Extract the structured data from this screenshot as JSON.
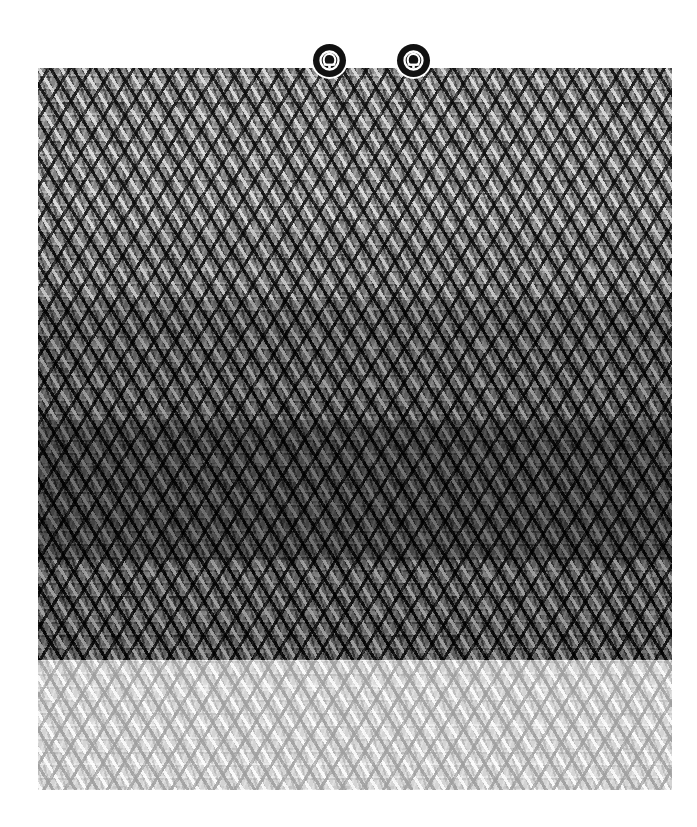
{
  "page": {
    "width": 697,
    "height": 827,
    "background_color": "#ffffff"
  },
  "scan_block": {
    "label": "Degraded scanned image region",
    "x": 38,
    "y": 68,
    "width": 634,
    "height": 722,
    "base_color": "#8d8d8d",
    "dark_color": "#111111",
    "light_color": "#ffffff",
    "description": "Grayscale moire interference pattern; diagonal crosshatch weave with horizontal banding. No legible text.",
    "bands": [
      {
        "name": "upper-crosshatch",
        "from_y": 68,
        "to_y": 228,
        "tone": "mid-gray"
      },
      {
        "name": "arch-row-band",
        "from_y": 228,
        "to_y": 300,
        "tone": "mid-gray-banded"
      },
      {
        "name": "dense-weave-band",
        "from_y": 300,
        "to_y": 420,
        "tone": "dark-mid"
      },
      {
        "name": "darkest-core-band",
        "from_y": 420,
        "to_y": 560,
        "tone": "darkest"
      },
      {
        "name": "lower-ripple-band",
        "from_y": 560,
        "to_y": 660,
        "tone": "dark-mid"
      },
      {
        "name": "fade-out-band",
        "from_y": 660,
        "to_y": 790,
        "tone": "light"
      }
    ]
  },
  "badges": [
    {
      "name": "emblem-badge-left",
      "icon": "emblem-ring-arch-icon",
      "center_x": 329,
      "center_y": 60,
      "diameter": 33,
      "color": "#111111",
      "mark_color": "#ffffff"
    },
    {
      "name": "emblem-badge-right",
      "icon": "emblem-ring-arch-icon",
      "center_x": 413,
      "center_y": 60,
      "diameter": 33,
      "color": "#111111",
      "mark_color": "#ffffff"
    }
  ],
  "edge_notch": {
    "name": "right-edge-white-notch",
    "x": 672,
    "y": 398,
    "width": 11,
    "height": 21,
    "color": "#ffffff"
  }
}
